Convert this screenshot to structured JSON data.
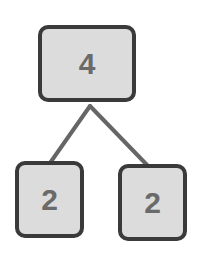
{
  "diagram": {
    "type": "factor-tree",
    "nodes": [
      {
        "id": "root",
        "value": "4"
      },
      {
        "id": "left",
        "value": "2"
      },
      {
        "id": "right",
        "value": "2"
      }
    ],
    "edges": [
      {
        "from": "root",
        "to": "left"
      },
      {
        "from": "root",
        "to": "right"
      }
    ],
    "colors": {
      "box_fill": "#dcdcdc",
      "box_border": "#3a3a3a",
      "text": "#6a6a6a",
      "edge": "#666666"
    }
  }
}
